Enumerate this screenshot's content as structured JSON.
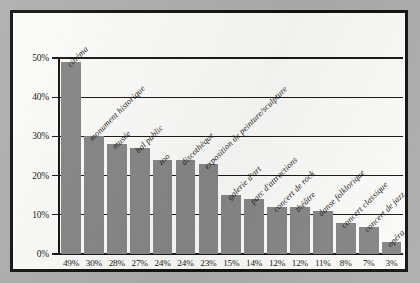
{
  "chart_data": {
    "type": "bar",
    "title": "",
    "subtitle": "",
    "xlabel": "",
    "ylabel": "",
    "ylim": [
      0,
      50
    ],
    "grid": true,
    "legend": "none",
    "orientation": "vertical",
    "bar_color": "#868686",
    "panel_background": "#fbfbf9",
    "frame_color": "#15130f",
    "page_background": "#aeaeae",
    "categories": [
      "cinéma",
      "monument historique",
      "musée",
      "bal public",
      "zoo",
      "discothèque",
      "exposition de peinture/sculpture",
      "galerie d'art",
      "parc d'attractions",
      "concert de rock",
      "théâtre",
      "danse folklorique",
      "concert classique",
      "concert de jazz",
      "opéra"
    ],
    "values": [
      49,
      30,
      28,
      27,
      24,
      24,
      23,
      15,
      14,
      12,
      12,
      11,
      8,
      7,
      3
    ],
    "value_labels": [
      "49%",
      "30%",
      "28%",
      "27%",
      "24%",
      "24%",
      "23%",
      "15%",
      "14%",
      "12%",
      "12%",
      "11%",
      "8%",
      "7%",
      "3%"
    ],
    "yticks": [
      0,
      10,
      20,
      30,
      40,
      50
    ],
    "ytick_labels": [
      "0%",
      "10%",
      "20%",
      "30%",
      "40%",
      "50%"
    ]
  }
}
